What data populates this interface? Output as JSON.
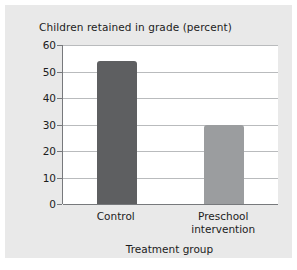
{
  "chart_data": {
    "type": "bar",
    "title": "Children retained in grade (percent)",
    "xlabel": "Treatment group",
    "ylabel": "",
    "categories": [
      "Control",
      "Preschool intervention"
    ],
    "values": [
      54,
      30
    ],
    "series": [
      {
        "name": "Children retained in grade (percent)",
        "values": [
          54,
          30
        ]
      }
    ],
    "ylim": [
      0,
      60
    ],
    "yticks": [
      0,
      10,
      20,
      30,
      40,
      50,
      60
    ],
    "ytick_labels": [
      "0",
      "10",
      "20",
      "30",
      "40",
      "50",
      "60"
    ],
    "grid": true,
    "legend": "none",
    "bar_colors": [
      "#5e5f61",
      "#9b9d9f"
    ],
    "panel_color": "#e9e9e9",
    "plot_background": "#ffffff",
    "axis_color": "#77797c",
    "gridline_color": "#b9bbbd",
    "text_color": "#1c1c1c"
  },
  "axis": {
    "x_tick_lines": [
      [
        "Control"
      ],
      [
        "Preschool",
        "intervention"
      ]
    ]
  }
}
